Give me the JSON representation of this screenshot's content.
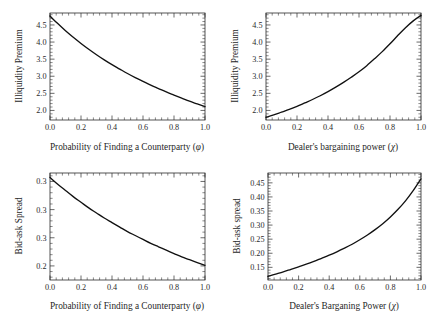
{
  "figure": {
    "title": "",
    "panel_count": 4,
    "background": "#ffffff",
    "curve_color": "#111111",
    "axis_color": "#2b2b2b"
  },
  "panels": {
    "top_left": {
      "name": "illiquidity-premium-vs-phi",
      "xlabel_text": "Probability of Finding a Counterparty (",
      "xlabel_symbol": "φ",
      "xlabel_close": ")",
      "ylabel": "Illiquidity Premium",
      "xticks": [
        "0.0",
        "0.2",
        "0.4",
        "0.6",
        "0.8",
        "1.0"
      ],
      "yticks": [
        "2.0",
        "2.5",
        "3.0",
        "3.5",
        "4.0",
        "4.5"
      ]
    },
    "top_right": {
      "name": "illiquidity-premium-vs-chi",
      "xlabel_text": "Dealer's bargaining power (",
      "xlabel_symbol": "χ",
      "xlabel_close": ")",
      "ylabel": "Illiquidity Premium",
      "xticks": [
        "0.0",
        "0.2",
        "0.4",
        "0.6",
        "0.8",
        "1.0"
      ],
      "yticks": [
        "2.0",
        "2.5",
        "3.0",
        "3.5",
        "4.0",
        "4.5"
      ]
    },
    "bottom_left": {
      "name": "bid-ask-spread-vs-phi",
      "xlabel_text": "Probability of Finding a Counterparty (",
      "xlabel_symbol": "φ",
      "xlabel_close": ")",
      "ylabel": "Bid-ask Spread",
      "xticks": [
        "0.0",
        "0.2",
        "0.4",
        "0.6",
        "0.8",
        "1.0"
      ],
      "yticks": [
        "0.20",
        "0.25",
        "0.30",
        "0.35"
      ]
    },
    "bottom_right": {
      "name": "bid-ask-spread-vs-chi",
      "xlabel_text": "Dealer's Barganing Power (",
      "xlabel_symbol": "χ",
      "xlabel_close": ")",
      "ylabel": "Bid-ask spread",
      "xticks": [
        "0.0",
        "0.2",
        "0.4",
        "0.6",
        "0.8",
        "1.0"
      ],
      "yticks": [
        "0.15",
        "0.20",
        "0.25",
        "0.30",
        "0.35",
        "0.40",
        "0.45"
      ]
    }
  },
  "chart_data": [
    {
      "type": "line",
      "panel": "top-left",
      "title": "",
      "xlabel": "Probability of Finding a Counterparty (φ)",
      "ylabel": "Illiquidity Premium",
      "xlim": [
        0.0,
        1.0
      ],
      "ylim": [
        1.72,
        4.85
      ],
      "xticks": [
        0.0,
        0.2,
        0.4,
        0.6,
        0.8,
        1.0
      ],
      "yticks": [
        2.0,
        2.5,
        3.0,
        3.5,
        4.0,
        4.5
      ],
      "grid": false,
      "legend": null,
      "x": [
        0.0,
        0.05,
        0.1,
        0.15,
        0.2,
        0.25,
        0.3,
        0.35,
        0.4,
        0.45,
        0.5,
        0.55,
        0.6,
        0.65,
        0.7,
        0.75,
        0.8,
        0.85,
        0.9,
        0.95,
        1.0
      ],
      "y": [
        4.76,
        4.54,
        4.33,
        4.14,
        3.96,
        3.79,
        3.63,
        3.48,
        3.34,
        3.21,
        3.08,
        2.96,
        2.85,
        2.74,
        2.64,
        2.54,
        2.45,
        2.36,
        2.27,
        2.19,
        2.11
      ]
    },
    {
      "type": "line",
      "panel": "top-right",
      "title": "",
      "xlabel": "Dealer's bargaining power (χ)",
      "ylabel": "Illiquidity Premium",
      "xlim": [
        0.0,
        1.0
      ],
      "ylim": [
        1.72,
        4.85
      ],
      "xticks": [
        0.0,
        0.2,
        0.4,
        0.6,
        0.8,
        1.0
      ],
      "yticks": [
        2.0,
        2.5,
        3.0,
        3.5,
        4.0,
        4.5
      ],
      "grid": false,
      "legend": null,
      "x": [
        0.0,
        0.05,
        0.1,
        0.15,
        0.2,
        0.25,
        0.3,
        0.35,
        0.4,
        0.45,
        0.5,
        0.55,
        0.6,
        0.65,
        0.7,
        0.75,
        0.8,
        0.85,
        0.9,
        0.95,
        1.0
      ],
      "y": [
        1.8,
        1.87,
        1.95,
        2.03,
        2.12,
        2.22,
        2.32,
        2.43,
        2.55,
        2.68,
        2.82,
        2.97,
        3.13,
        3.31,
        3.51,
        3.72,
        3.95,
        4.19,
        4.42,
        4.62,
        4.78
      ]
    },
    {
      "type": "line",
      "panel": "bottom-left",
      "title": "",
      "xlabel": "Probability of Finding a Counterparty (φ)",
      "ylabel": "Bid-ask Spread",
      "xlim": [
        0.0,
        1.0
      ],
      "ylim": [
        0.175,
        0.365
      ],
      "xticks": [
        0.0,
        0.2,
        0.4,
        0.6,
        0.8,
        1.0
      ],
      "yticks": [
        0.2,
        0.25,
        0.3,
        0.35
      ],
      "grid": false,
      "legend": null,
      "x": [
        0.0,
        0.05,
        0.1,
        0.15,
        0.2,
        0.25,
        0.3,
        0.35,
        0.4,
        0.45,
        0.5,
        0.55,
        0.6,
        0.65,
        0.7,
        0.75,
        0.8,
        0.85,
        0.9,
        0.95,
        1.0
      ],
      "y": [
        0.357,
        0.345,
        0.334,
        0.323,
        0.313,
        0.303,
        0.294,
        0.285,
        0.277,
        0.269,
        0.261,
        0.254,
        0.247,
        0.24,
        0.234,
        0.228,
        0.222,
        0.216,
        0.211,
        0.206,
        0.201
      ]
    },
    {
      "type": "line",
      "panel": "bottom-right",
      "title": "",
      "xlabel": "Dealer's Barganing Power (χ)",
      "ylabel": "Bid-ask spread",
      "xlim": [
        0.0,
        1.0
      ],
      "ylim": [
        0.105,
        0.485
      ],
      "xticks": [
        0.0,
        0.2,
        0.4,
        0.6,
        0.8,
        1.0
      ],
      "yticks": [
        0.15,
        0.2,
        0.25,
        0.3,
        0.35,
        0.4,
        0.45
      ],
      "grid": false,
      "legend": null,
      "x": [
        0.0,
        0.05,
        0.1,
        0.15,
        0.2,
        0.25,
        0.3,
        0.35,
        0.4,
        0.45,
        0.5,
        0.55,
        0.6,
        0.65,
        0.7,
        0.75,
        0.8,
        0.85,
        0.9,
        0.95,
        1.0
      ],
      "y": [
        0.118,
        0.126,
        0.134,
        0.143,
        0.152,
        0.161,
        0.171,
        0.182,
        0.193,
        0.205,
        0.218,
        0.232,
        0.248,
        0.265,
        0.284,
        0.305,
        0.329,
        0.356,
        0.387,
        0.423,
        0.464
      ]
    }
  ]
}
